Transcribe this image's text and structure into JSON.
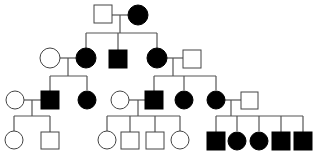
{
  "diagram": {
    "type": "pedigree",
    "colors": {
      "affected": "#000000",
      "unaffected": "#ffffff",
      "line": "#555555"
    },
    "generations": [
      {
        "label": "I",
        "individuals": [
          {
            "id": "I-1",
            "sex": "male",
            "affected": false
          },
          {
            "id": "I-2",
            "sex": "female",
            "affected": true
          }
        ]
      },
      {
        "label": "II",
        "individuals": [
          {
            "id": "II-spouse-1",
            "sex": "female",
            "affected": false
          },
          {
            "id": "II-1",
            "sex": "female",
            "affected": true
          },
          {
            "id": "II-2",
            "sex": "male",
            "affected": true
          },
          {
            "id": "II-3",
            "sex": "female",
            "affected": true
          },
          {
            "id": "II-spouse-3",
            "sex": "male",
            "affected": false
          }
        ]
      },
      {
        "label": "III",
        "individuals": [
          {
            "id": "III-spouse-1",
            "sex": "female",
            "affected": false
          },
          {
            "id": "III-1",
            "sex": "male",
            "affected": true
          },
          {
            "id": "III-2",
            "sex": "female",
            "affected": true
          },
          {
            "id": "III-spouse-3",
            "sex": "female",
            "affected": false
          },
          {
            "id": "III-3",
            "sex": "male",
            "affected": true
          },
          {
            "id": "III-4",
            "sex": "female",
            "affected": true
          },
          {
            "id": "III-5",
            "sex": "female",
            "affected": true
          },
          {
            "id": "III-spouse-5",
            "sex": "male",
            "affected": false
          }
        ]
      },
      {
        "label": "IV",
        "individuals": [
          {
            "id": "IV-1",
            "sex": "female",
            "affected": false
          },
          {
            "id": "IV-2",
            "sex": "male",
            "affected": false
          },
          {
            "id": "IV-3",
            "sex": "female",
            "affected": false
          },
          {
            "id": "IV-4",
            "sex": "male",
            "affected": false
          },
          {
            "id": "IV-5",
            "sex": "male",
            "affected": false
          },
          {
            "id": "IV-6",
            "sex": "female",
            "affected": false
          },
          {
            "id": "IV-7",
            "sex": "male",
            "affected": true
          },
          {
            "id": "IV-8",
            "sex": "female",
            "affected": true
          },
          {
            "id": "IV-9",
            "sex": "female",
            "affected": true
          },
          {
            "id": "IV-10",
            "sex": "male",
            "affected": true
          },
          {
            "id": "IV-11",
            "sex": "male",
            "affected": true
          }
        ]
      }
    ]
  }
}
